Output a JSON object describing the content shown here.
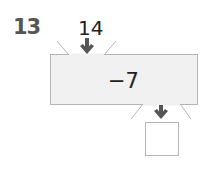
{
  "problem": {
    "number": "13",
    "input_value": "14",
    "operation": "−7",
    "answer": ""
  },
  "colors": {
    "machine_fill": "#f1f1f1",
    "machine_border": "#b5b5b5",
    "arrow": "#555555",
    "number": "#555555",
    "text": "#222222"
  }
}
